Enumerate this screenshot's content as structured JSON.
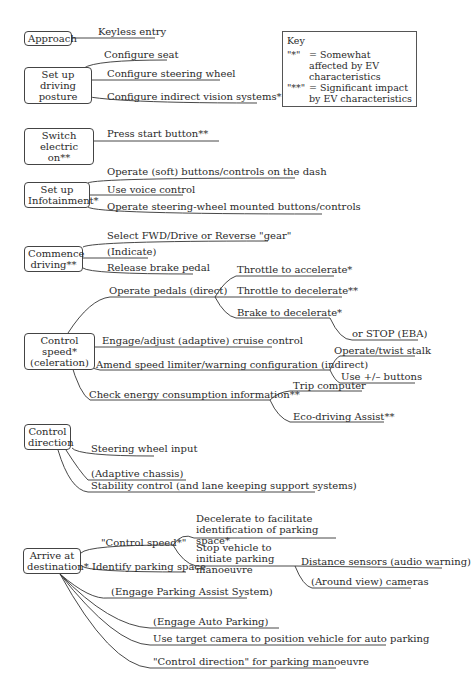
{
  "header": {
    "running_title": "",
    "page_number": ""
  },
  "key": {
    "title": "Key",
    "entries": [
      {
        "symbol": "\"*\"",
        "text": "= Somewhat affected by EV characteristics"
      },
      {
        "symbol": "\"**\"",
        "text": "= Significant impact by EV characteristics"
      }
    ]
  },
  "tasks": {
    "approach": {
      "label": "Approach",
      "items": [
        "Keyless entry"
      ]
    },
    "posture": {
      "label": "Set up driving posture",
      "items": [
        "Configure seat",
        "Configure steering wheel",
        "Configure indirect vision systems*"
      ]
    },
    "switch": {
      "label": "Switch electric on**",
      "items": [
        "Press start button**"
      ]
    },
    "infotainment": {
      "label": "Set up Infotainment*",
      "items": [
        "Operate (soft) buttons/controls on the dash",
        "Use voice control",
        "Operate steering-wheel mounted buttons/controls"
      ]
    },
    "commence": {
      "label": "Commence driving**",
      "items": [
        "Select FWD/Drive or Reverse \"gear\"",
        "(Indicate)",
        "Release brake pedal"
      ]
    },
    "speed": {
      "label": "Control speed* (celeration)",
      "items": [
        "Operate pedals (direct)",
        "Engage/adjust (adaptive) cruise control",
        "Amend speed limiter/warning configuration (indirect)",
        "Check energy consumption information**"
      ],
      "pedals": [
        "Throttle to accelerate*",
        "Throttle to decelerate**",
        "Brake to decelerate*",
        "or STOP (EBA)"
      ],
      "limiter": [
        "Operate/twist stalk",
        "Use +/– buttons"
      ],
      "energy": [
        "Trip computer",
        "Eco-driving Assist**"
      ]
    },
    "direction": {
      "label": "Control direction",
      "items": [
        "Steering wheel input",
        "(Adaptive chassis)",
        "Stability control (and lane keeping support systems)"
      ]
    },
    "arrive": {
      "label": "Arrive at destination*",
      "items": [
        "\"Control speed*\"",
        "Identify parking space",
        "(Engage Parking Assist System)",
        "(Engage Auto Parking)",
        "Use target camera to position vehicle for auto parking",
        "\"Control direction\" for parking manoeuvre"
      ],
      "speed_sub": [
        "Decelerate to facilitate identification of parking space*",
        "Stop vehicle to initiate parking manoeuvre"
      ],
      "stop_sub": [
        "Distance sensors (audio warning)",
        "(Around view) cameras"
      ]
    }
  }
}
